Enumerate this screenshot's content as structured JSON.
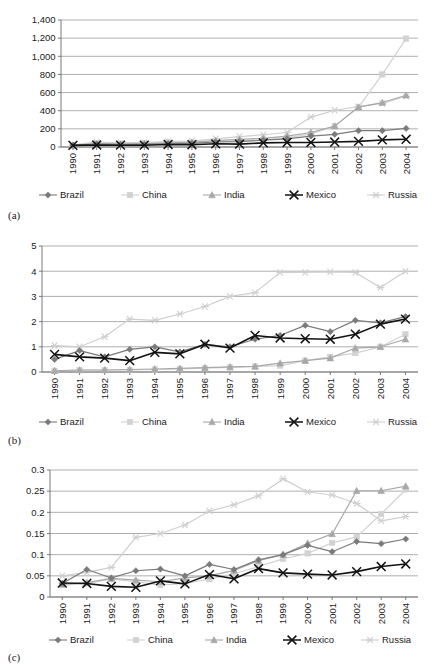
{
  "figure": {
    "panels": [
      "(a)",
      "(b)",
      "(c)"
    ],
    "legend_labels": [
      "Brazil",
      "China",
      "India",
      "Mexico",
      "Russia"
    ],
    "series_colors": {
      "Brazil": "#7a7a7a",
      "China": "#d2d2d2",
      "India": "#a8a8a8",
      "Mexico": "#121212",
      "Russia": "#cfcfcf"
    },
    "series_markers": {
      "Brazil": "diamond",
      "China": "square",
      "India": "triangle",
      "Mexico": "x",
      "Russia": "asterisk"
    }
  },
  "chart_data": [
    {
      "type": "line",
      "panel": "(a)",
      "title": "",
      "xlabel": "",
      "ylabel": "",
      "grid": true,
      "legend_position": "bottom",
      "ylim": [
        0,
        1400
      ],
      "yticks": [
        0,
        200,
        400,
        600,
        800,
        1000,
        1200,
        1400
      ],
      "ytick_labels": [
        "0",
        "200",
        "400",
        "600",
        "800",
        "1,000",
        "1,200",
        "1,400"
      ],
      "categories": [
        "1990",
        "1991",
        "1992",
        "1993",
        "1994",
        "1995",
        "1996",
        "1997",
        "1998",
        "1999",
        "2000",
        "2001",
        "2002",
        "2003",
        "2004"
      ],
      "series": [
        {
          "name": "Brazil",
          "values": [
            20,
            35,
            30,
            28,
            35,
            40,
            55,
            60,
            75,
            90,
            120,
            140,
            180,
            180,
            205
          ]
        },
        {
          "name": "China",
          "values": [
            18,
            40,
            35,
            40,
            45,
            50,
            60,
            70,
            80,
            100,
            145,
            230,
            440,
            800,
            1195
          ]
        },
        {
          "name": "India",
          "values": [
            15,
            25,
            30,
            35,
            45,
            50,
            70,
            85,
            95,
            120,
            160,
            230,
            440,
            490,
            570
          ]
        },
        {
          "name": "Mexico",
          "values": [
            18,
            22,
            20,
            20,
            28,
            25,
            35,
            32,
            45,
            50,
            50,
            55,
            62,
            78,
            85
          ]
        },
        {
          "name": "Russia",
          "values": [
            25,
            55,
            45,
            50,
            60,
            65,
            90,
            115,
            135,
            160,
            330,
            405,
            445,
            480,
            560
          ]
        }
      ]
    },
    {
      "type": "line",
      "panel": "(b)",
      "title": "",
      "xlabel": "",
      "ylabel": "",
      "grid": true,
      "legend_position": "bottom",
      "ylim": [
        0,
        5
      ],
      "yticks": [
        0,
        1,
        2,
        3,
        4,
        5
      ],
      "ytick_labels": [
        "0",
        "1",
        "2",
        "3",
        "4",
        "5"
      ],
      "categories": [
        "1990",
        "1991",
        "1992",
        "1993",
        "1994",
        "1995",
        "1996",
        "1997",
        "1998",
        "1999",
        "2000",
        "2001",
        "2002",
        "2003",
        "2004"
      ],
      "series": [
        {
          "name": "Brazil",
          "values": [
            0.5,
            0.85,
            0.6,
            0.9,
            1.0,
            0.8,
            1.1,
            1.0,
            1.3,
            1.45,
            1.85,
            1.6,
            2.05,
            1.95,
            2.2
          ]
        },
        {
          "name": "China",
          "values": [
            0.05,
            0.08,
            0.08,
            0.08,
            0.1,
            0.12,
            0.15,
            0.18,
            0.22,
            0.25,
            0.45,
            0.6,
            0.75,
            1.0,
            1.5
          ]
        },
        {
          "name": "India",
          "values": [
            0.05,
            0.08,
            0.08,
            0.1,
            0.12,
            0.14,
            0.17,
            0.2,
            0.22,
            0.35,
            0.45,
            0.55,
            0.95,
            1.0,
            1.3
          ]
        },
        {
          "name": "Mexico",
          "values": [
            0.7,
            0.6,
            0.55,
            0.45,
            0.78,
            0.72,
            1.1,
            0.95,
            1.45,
            1.35,
            1.32,
            1.3,
            1.5,
            1.9,
            2.1
          ]
        },
        {
          "name": "Russia",
          "values": [
            1.05,
            1.0,
            1.4,
            2.1,
            2.05,
            2.3,
            2.6,
            3.0,
            3.15,
            3.95,
            3.95,
            3.97,
            3.95,
            3.35,
            4.0
          ]
        }
      ]
    },
    {
      "type": "line",
      "panel": "(c)",
      "title": "",
      "xlabel": "",
      "ylabel": "",
      "grid": true,
      "legend_position": "bottom",
      "ylim": [
        0,
        0.3
      ],
      "yticks": [
        0,
        0.05,
        0.1,
        0.15,
        0.2,
        0.25,
        0.3
      ],
      "ytick_labels": [
        "0",
        "0.05",
        "0.1",
        "0.15",
        "0.2",
        "0.25",
        "0.3"
      ],
      "categories": [
        "1990",
        "1991",
        "1992",
        "1993",
        "1994",
        "1995",
        "1996",
        "1997",
        "1998",
        "1999",
        "2000",
        "2001",
        "2002",
        "2003",
        "2004"
      ],
      "series": [
        {
          "name": "Brazil",
          "values": [
            0.032,
            0.065,
            0.045,
            0.062,
            0.066,
            0.05,
            0.077,
            0.065,
            0.088,
            0.1,
            0.122,
            0.107,
            0.131,
            0.126,
            0.137
          ]
        },
        {
          "name": "China",
          "values": [
            0.028,
            0.032,
            0.042,
            0.036,
            0.028,
            0.032,
            0.042,
            0.055,
            0.072,
            0.09,
            0.103,
            0.128,
            0.142,
            0.196,
            0.254
          ]
        },
        {
          "name": "India",
          "values": [
            0.03,
            0.034,
            0.044,
            0.04,
            0.036,
            0.045,
            0.05,
            0.063,
            0.086,
            0.1,
            0.127,
            0.149,
            0.251,
            0.251,
            0.262
          ]
        },
        {
          "name": "Mexico",
          "values": [
            0.033,
            0.032,
            0.025,
            0.023,
            0.038,
            0.031,
            0.053,
            0.043,
            0.067,
            0.057,
            0.054,
            0.052,
            0.06,
            0.072,
            0.078
          ]
        },
        {
          "name": "Russia",
          "values": [
            0.05,
            0.058,
            0.07,
            0.141,
            0.15,
            0.17,
            0.203,
            0.218,
            0.239,
            0.279,
            0.248,
            0.241,
            0.221,
            0.18,
            0.19
          ]
        }
      ]
    }
  ]
}
